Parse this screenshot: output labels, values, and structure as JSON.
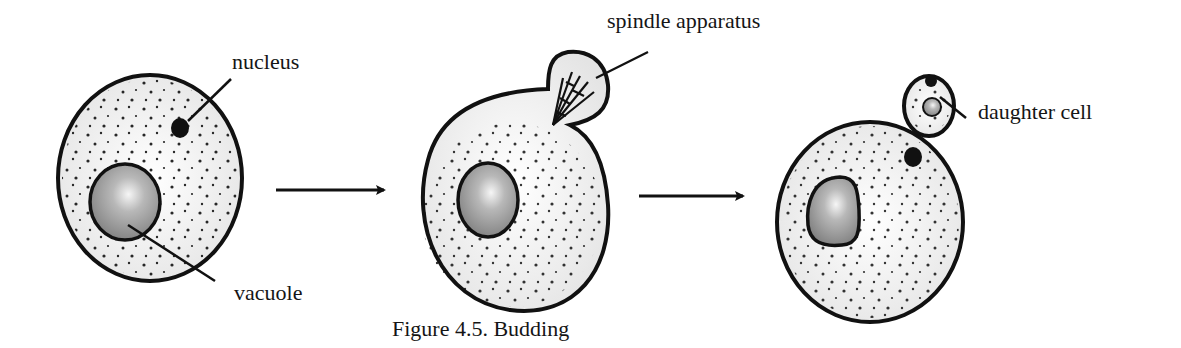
{
  "figure": {
    "caption": "Figure 4.5. Budding",
    "title": "Budding"
  },
  "labels": {
    "nucleus": "nucleus",
    "vacuole": "vacuole",
    "spindle_apparatus": "spindle apparatus",
    "daughter_cell": "daughter cell"
  },
  "stages": [
    {
      "name": "parent cell",
      "components": [
        "nucleus",
        "vacuole",
        "cytoplasm granules"
      ]
    },
    {
      "name": "bud forming",
      "components": [
        "spindle apparatus",
        "vacuole",
        "cytoplasm granules"
      ]
    },
    {
      "name": "daughter cell formed",
      "components": [
        "daughter cell",
        "nucleus",
        "vacuole",
        "cytoplasm granules"
      ]
    }
  ],
  "colors": {
    "outline": "#111111",
    "cytoplasm": "#f1f1f1",
    "vacuole_light": "#f4f4f4",
    "vacuole_dark": "#8a8a8a",
    "nucleus": "#111111"
  }
}
